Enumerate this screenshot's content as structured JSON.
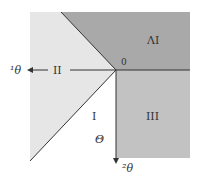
{
  "diagram": {
    "orientation": "rotated-180",
    "colors": {
      "region_iv": "#a9a9a9",
      "region_iii": "#c2c2c2",
      "region_ii": "#e6e6e6",
      "region_i": "#ffffff",
      "line": "#333333"
    },
    "labels": {
      "origin": "0",
      "region_i": "I",
      "region_ii": "II",
      "region_iii": "III",
      "region_iv": "ΛI",
      "theta": "Θ",
      "axis_left": "¹θ",
      "axis_down": "²θ"
    }
  }
}
